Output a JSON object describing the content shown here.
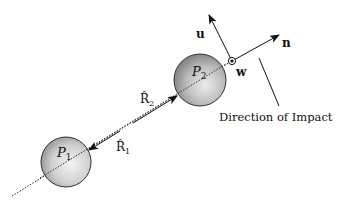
{
  "diagram": {
    "particles": [
      {
        "label": "P",
        "subscript": "1"
      },
      {
        "label": "P",
        "subscript": "2"
      }
    ],
    "vectors": {
      "r1": {
        "label": "R̂",
        "subscript": "1"
      },
      "r2": {
        "label": "R̂",
        "subscript": "2"
      },
      "u": "u",
      "n": "n",
      "w": "w"
    },
    "annotation": "Direction of Impact",
    "colors": {
      "line": "#111111",
      "sphere_light": "#f2f2f2",
      "sphere_dark": "#8e8e8e",
      "background": "#ffffff"
    }
  }
}
